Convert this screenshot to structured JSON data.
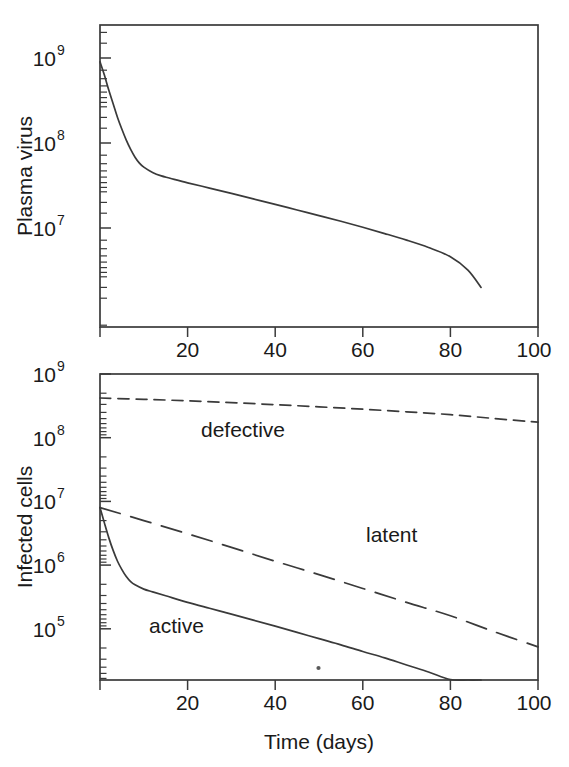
{
  "figure": {
    "background": "#ffffff",
    "ink_color": "#3a3a3a",
    "text_color": "#1a1a1a"
  },
  "panels": {
    "top": {
      "name": "plasma-virus-panel",
      "ylabel": "Plasma virus",
      "y_ticks": [
        "10",
        "10",
        "10"
      ],
      "y_tick_exponents": [
        "9",
        "8",
        "7"
      ],
      "x_ticks": [
        "20",
        "40",
        "60",
        "80",
        "100"
      ]
    },
    "bottom": {
      "name": "infected-cells-panel",
      "ylabel": "Infected cells",
      "xlabel": "Time (days)",
      "y_ticks": [
        "10",
        "10",
        "10",
        "10",
        "10"
      ],
      "y_tick_exponents": [
        "9",
        "8",
        "7",
        "6",
        "5"
      ],
      "x_ticks": [
        "20",
        "40",
        "60",
        "80",
        "100"
      ],
      "curve_labels": {
        "defective": "defective",
        "latent": "latent",
        "active": "active"
      }
    }
  },
  "chart_data": [
    {
      "type": "line",
      "title": "Plasma virus",
      "xlabel": "",
      "ylabel": "Plasma virus",
      "yscale": "log",
      "xlim": [
        0,
        100
      ],
      "ylim": [
        1000000,
        2000000000
      ],
      "xticks": [
        20,
        40,
        60,
        80,
        100
      ],
      "yticks": [
        10000000,
        100000000,
        1000000000
      ],
      "ytick_labels": [
        "10^7",
        "10^8",
        "10^9"
      ],
      "grid": false,
      "legend": "none",
      "series": [
        {
          "name": "plasma virus",
          "style": "solid",
          "x": [
            0,
            1,
            2,
            3,
            4,
            5,
            6,
            7,
            8,
            9,
            10,
            12,
            14,
            16,
            20,
            25,
            30,
            35,
            40,
            45,
            50,
            55,
            60,
            65,
            70,
            75,
            80,
            84,
            87
          ],
          "y": [
            900000000.0,
            630000000.0,
            420000000.0,
            290000000.0,
            200000000.0,
            145000000.0,
            108000000.0,
            84000000.0,
            68000000.0,
            58000000.0,
            52000000.0,
            45000000.0,
            41000000.0,
            38500000.0,
            34000000.0,
            29500000.0,
            25500000.0,
            22000000.0,
            19000000.0,
            16300000.0,
            14000000.0,
            12000000.0,
            10200000.0,
            8600000.0,
            7200000.0,
            5900000.0,
            4600000.0,
            3200000.0,
            2000000.0
          ]
        }
      ]
    },
    {
      "type": "line",
      "title": "Infected cells",
      "xlabel": "Time (days)",
      "ylabel": "Infected cells",
      "yscale": "log",
      "xlim": [
        0,
        100
      ],
      "ylim": [
        10000,
        1000000000
      ],
      "xticks": [
        20,
        40,
        60,
        80,
        100
      ],
      "yticks": [
        100000,
        1000000,
        10000000,
        100000000,
        1000000000
      ],
      "ytick_labels": [
        "10^5",
        "10^6",
        "10^7",
        "10^8",
        "10^9"
      ],
      "grid": false,
      "legend": "inline-annotations",
      "series": [
        {
          "name": "defective",
          "style": "short-dash",
          "label_x": 42,
          "label_y": 200000000,
          "x": [
            0,
            10,
            20,
            30,
            40,
            50,
            60,
            70,
            80,
            90,
            100
          ],
          "y": [
            420000000.0,
            400000000.0,
            380000000.0,
            355000000.0,
            330000000.0,
            305000000.0,
            280000000.0,
            255000000.0,
            230000000.0,
            200000000.0,
            175000000.0
          ]
        },
        {
          "name": "latent",
          "style": "long-dash",
          "label_x": 62,
          "label_y": 1800000,
          "x": [
            0,
            10,
            20,
            30,
            40,
            50,
            60,
            70,
            80,
            90,
            100
          ],
          "y": [
            8000000.0,
            5000000.0,
            3100000.0,
            1900000.0,
            1150000.0,
            710000.0,
            430000.0,
            260000.0,
            160000.0,
            90000.0,
            52000.0
          ]
        },
        {
          "name": "active",
          "style": "solid",
          "label_x": 20,
          "label_y": 110000,
          "x": [
            0,
            1,
            2,
            3,
            4,
            5,
            6,
            7,
            8,
            10,
            12,
            15,
            20,
            25,
            30,
            35,
            40,
            45,
            50,
            55,
            60,
            65,
            70,
            75,
            80,
            84,
            87
          ],
          "y": [
            8000000.0,
            4600000.0,
            2700000.0,
            1700000.0,
            1150000.0,
            850000.0,
            660000.0,
            550000.0,
            490000.0,
            420000.0,
            380000.0,
            330000.0,
            260000.0,
            210000.0,
            170000.0,
            137000.0,
            110000.0,
            88000.0,
            70000.0,
            56000.0,
            44000.0,
            35000.0,
            27000.0,
            21000.0,
            16000.0,
            12000.0,
            10000.0
          ]
        }
      ]
    }
  ]
}
